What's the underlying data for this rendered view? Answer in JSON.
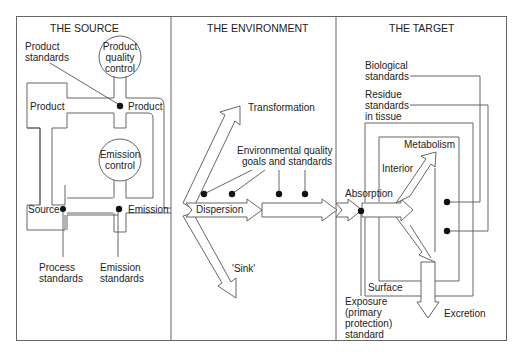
{
  "panels": {
    "source": {
      "title": "THE SOURCE",
      "product_standards": [
        "Product",
        "standards"
      ],
      "product_quality_control": [
        "Product",
        "quality",
        "control"
      ],
      "product_left": "Product",
      "product_right": "Product",
      "emission_control": [
        "Emission",
        "control"
      ],
      "source": "Source",
      "emission": "Emission",
      "process_standards": [
        "Process",
        "standards"
      ],
      "emission_standards": [
        "Emission",
        "standards"
      ]
    },
    "environment": {
      "title": "THE ENVIRONMENT",
      "transformation": "Transformation",
      "eq_goals": [
        "Environmental quality",
        "goals and standards"
      ],
      "dispersion": "Dispersion",
      "sink": "'Sink'"
    },
    "target": {
      "title": "THE TARGET",
      "biological_standards": [
        "Biological",
        "standards"
      ],
      "residue_standards": [
        "Residue",
        "standards",
        "in tissue"
      ],
      "metabolism": "Metabolism",
      "interior": "Interior",
      "absorption": "Absorption",
      "surface": "Surface",
      "exposure_standard": [
        "Exposure",
        "(primary",
        "protection)",
        "standard"
      ],
      "excretion": "Excretion"
    }
  },
  "colors": {
    "line": "#555555",
    "dot": "#111111",
    "text": "#222222",
    "background": "#ffffff"
  }
}
